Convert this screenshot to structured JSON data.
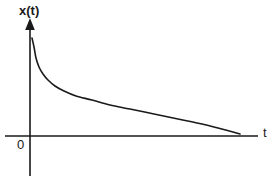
{
  "figure": {
    "title": "",
    "background_color": "#ffffff",
    "ink_color": "#1a1a1a",
    "labels": {
      "y_axis": "x(t)",
      "x_axis": "t",
      "origin": "0"
    },
    "artifact_text": ""
  },
  "chart_data": {
    "type": "line",
    "title": "",
    "xlabel": "t",
    "ylabel": "x(t)",
    "legend": [],
    "grid": false,
    "axis_style": "arrowed-y-axis",
    "xlim": [
      0,
      11
    ],
    "ylim": [
      0,
      10
    ],
    "axes_pixels": {
      "x_axis_y": 136,
      "x_axis_start_x": 5,
      "x_axis_end_x": 258,
      "y_axis_x": 30,
      "y_axis_top_y": 19,
      "y_axis_bottom_y": 176,
      "arrow_tip_y": 19
    },
    "series": [
      {
        "name": "x(t)",
        "description": "monotonically decaying curve, steep initial drop then long flat tail approaching the t axis",
        "x": [
          0.1,
          0.18,
          0.3,
          0.45,
          0.65,
          0.9,
          1.25,
          1.7,
          2.3,
          3.1,
          4.0,
          5.0,
          6.2,
          7.4,
          8.6,
          9.4,
          9.9
        ],
        "y": [
          9.3,
          8.2,
          6.7,
          5.6,
          4.75,
          4.1,
          3.5,
          3.0,
          2.55,
          2.15,
          1.8,
          1.5,
          1.18,
          0.88,
          0.55,
          0.3,
          0.1
        ],
        "pixel_points": [
          [
            32,
            38
          ],
          [
            34,
            47
          ],
          [
            36,
            58
          ],
          [
            39,
            67
          ],
          [
            43,
            74
          ],
          [
            48,
            80
          ],
          [
            55,
            86
          ],
          [
            64,
            91
          ],
          [
            76,
            96
          ],
          [
            92,
            100
          ],
          [
            110,
            105
          ],
          [
            130,
            109
          ],
          [
            154,
            114
          ],
          [
            178,
            119
          ],
          [
            202,
            124
          ],
          [
            218,
            128
          ],
          [
            240,
            134
          ]
        ],
        "color": "#1a1a1a",
        "linewidth": 1.6
      }
    ]
  }
}
